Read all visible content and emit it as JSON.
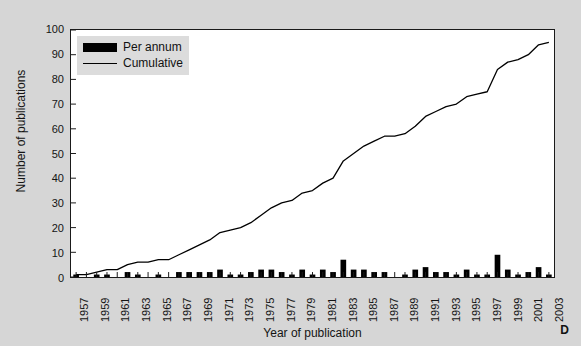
{
  "figure": {
    "panel_letter": "D",
    "background_color": "#d6d6d6",
    "plot_background_color": "#ffffff",
    "series_color": "#000000"
  },
  "legend": {
    "position": "top-left-inside",
    "background_color": "#dcdcdc",
    "entries": [
      {
        "label": "Per annum",
        "marker": "filled-bar-swatch"
      },
      {
        "label": "Cumulative",
        "marker": "line-swatch"
      }
    ]
  },
  "chart_data": {
    "type": "bar",
    "title": "",
    "subtitle": "",
    "xlabel": "Year of publication",
    "ylabel": "Number of publications",
    "xlim": [
      1956.5,
      2003.5
    ],
    "ylim": [
      0,
      100
    ],
    "yticks": [
      0,
      10,
      20,
      30,
      40,
      50,
      60,
      70,
      80,
      90,
      100
    ],
    "ytick_labels": [
      "0",
      "10",
      "20",
      "30",
      "40",
      "50",
      "60",
      "70",
      "80",
      "90",
      "100"
    ],
    "xticks": [
      1957,
      1958,
      1959,
      1960,
      1961,
      1962,
      1963,
      1964,
      1965,
      1966,
      1967,
      1968,
      1969,
      1970,
      1971,
      1972,
      1973,
      1974,
      1975,
      1976,
      1977,
      1978,
      1979,
      1980,
      1981,
      1982,
      1983,
      1984,
      1985,
      1986,
      1987,
      1988,
      1989,
      1990,
      1991,
      1992,
      1993,
      1994,
      1995,
      1996,
      1997,
      1998,
      1999,
      2000,
      2001,
      2002,
      2003
    ],
    "xtick_labels_shown": [
      "1957",
      "1959",
      "1961",
      "1963",
      "1965",
      "1967",
      "1969",
      "1971",
      "1973",
      "1975",
      "1977",
      "1979",
      "1981",
      "1983",
      "1985",
      "1987",
      "1989",
      "1991",
      "1993",
      "1995",
      "1997",
      "1999",
      "2001",
      "2003"
    ],
    "xtick_label_interval": 2,
    "grid": false,
    "legend_position": "upper left",
    "categories": [
      1957,
      1958,
      1959,
      1960,
      1961,
      1962,
      1963,
      1964,
      1965,
      1966,
      1967,
      1968,
      1969,
      1970,
      1971,
      1972,
      1973,
      1974,
      1975,
      1976,
      1977,
      1978,
      1979,
      1980,
      1981,
      1982,
      1983,
      1984,
      1985,
      1986,
      1987,
      1988,
      1989,
      1990,
      1991,
      1992,
      1993,
      1994,
      1995,
      1996,
      1997,
      1998,
      1999,
      2000,
      2001,
      2002,
      2003
    ],
    "series": [
      {
        "name": "Per annum",
        "type": "bar",
        "values": [
          1,
          0,
          1,
          1,
          0,
          2,
          1,
          0,
          1,
          0,
          2,
          2,
          2,
          2,
          3,
          1,
          1,
          2,
          3,
          3,
          2,
          1,
          3,
          1,
          3,
          2,
          7,
          3,
          3,
          2,
          2,
          0,
          1,
          3,
          4,
          2,
          2,
          1,
          3,
          1,
          1,
          9,
          3,
          1,
          2,
          4,
          1
        ]
      },
      {
        "name": "Cumulative",
        "type": "line",
        "values": [
          1,
          1,
          2,
          3,
          3,
          5,
          6,
          6,
          7,
          7,
          9,
          11,
          13,
          15,
          18,
          19,
          20,
          22,
          25,
          28,
          30,
          31,
          34,
          35,
          38,
          40,
          47,
          50,
          53,
          55,
          57,
          57,
          58,
          61,
          65,
          67,
          69,
          70,
          73,
          74,
          75,
          84,
          87,
          88,
          90,
          94,
          95
        ]
      }
    ]
  }
}
